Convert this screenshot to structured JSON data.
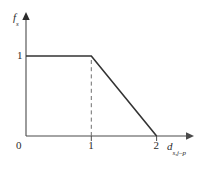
{
  "chart_data": {
    "type": "line",
    "title": "",
    "subtitle": "",
    "xlabel": "d_s,j-p",
    "ylabel": "f_s",
    "xlabel_base": "d",
    "xlabel_sub": "s,j–p",
    "ylabel_base": "f",
    "ylabel_sub": "s",
    "xlim": [
      0,
      2.45
    ],
    "ylim": [
      0,
      1.45
    ],
    "xticks": [
      0,
      1,
      2
    ],
    "xticklabels": [
      "0",
      "1",
      "2"
    ],
    "yticks": [
      1
    ],
    "yticklabels": [
      "1"
    ],
    "origin_label": "0",
    "grid": false,
    "legend": null,
    "series": [
      {
        "name": "membership",
        "x": [
          0,
          1,
          2
        ],
        "values": [
          1,
          1,
          0
        ],
        "color": "#333333",
        "style": "solid",
        "width": 1.6
      }
    ],
    "annotations": [
      {
        "name": "dashed-guide-at-x-1",
        "type": "dashed-vertical",
        "x": 1,
        "y_from": 0,
        "y_to": 1,
        "color": "#6e6e6e"
      }
    ],
    "axis_color": "#4a4a4a",
    "arrowheads": [
      "x-axis-end",
      "y-axis-end"
    ],
    "background": "#ffffff"
  },
  "figure": {
    "tick_one_y": "1",
    "tick_one_x": "1",
    "tick_two_x": "2",
    "tick_zero": "0"
  }
}
